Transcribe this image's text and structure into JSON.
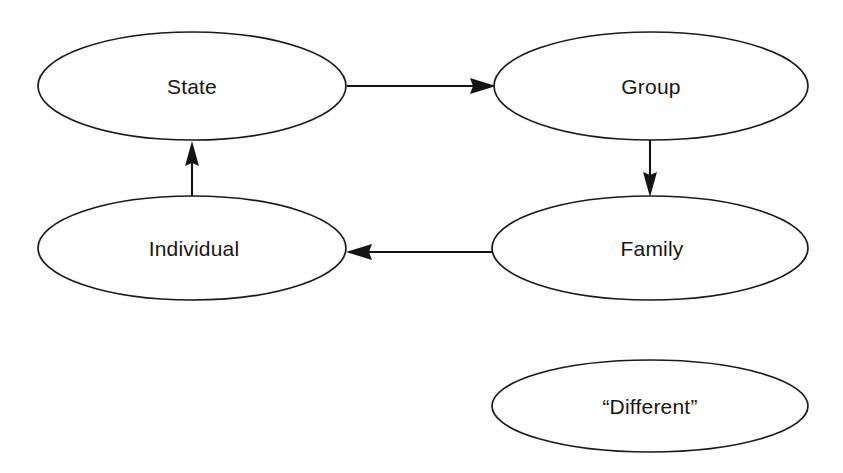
{
  "diagram": {
    "title": "",
    "background_color": "#ffffff",
    "stroke_color": "#1a1a1a",
    "text_color": "#161616",
    "nodes": [
      {
        "id": "state",
        "label": "State",
        "shape": "ellipse",
        "cx": 192,
        "cy": 86,
        "rx": 154,
        "ry": 54
      },
      {
        "id": "group",
        "label": "Group",
        "shape": "ellipse",
        "cx": 651,
        "cy": 86,
        "rx": 157,
        "ry": 54
      },
      {
        "id": "individual",
        "label": "Individual",
        "shape": "ellipse",
        "cx": 192,
        "cy": 248,
        "rx": 154,
        "ry": 52
      },
      {
        "id": "family",
        "label": "Family",
        "shape": "ellipse",
        "cx": 650,
        "cy": 248,
        "rx": 158,
        "ry": 52
      },
      {
        "id": "different",
        "label": "“Different”",
        "shape": "ellipse",
        "cx": 650,
        "cy": 406,
        "rx": 158,
        "ry": 46
      }
    ],
    "edges": [
      {
        "id": "state-to-group",
        "from": "state",
        "to": "group",
        "label": "",
        "direction": "right",
        "arrowhead": "filled-triangle"
      },
      {
        "id": "group-to-family",
        "from": "group",
        "to": "family",
        "label": "",
        "direction": "down",
        "arrowhead": "filled-triangle"
      },
      {
        "id": "family-to-individual",
        "from": "family",
        "to": "individual",
        "label": "",
        "direction": "left",
        "arrowhead": "filled-triangle"
      },
      {
        "id": "individual-to-state",
        "from": "individual",
        "to": "state",
        "label": "",
        "direction": "up",
        "arrowhead": "filled-triangle"
      }
    ]
  }
}
